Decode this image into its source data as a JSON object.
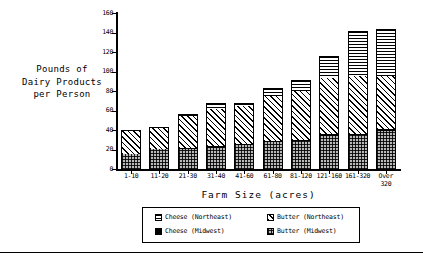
{
  "axis_titles": {
    "y": "Pounds of\nDairy Products\nper Person",
    "x": "Farm Size  (acres)"
  },
  "yticks": [
    "0",
    "20",
    "40",
    "60",
    "80",
    "100",
    "120",
    "140",
    "160"
  ],
  "legend": {
    "items": [
      {
        "label": "Cheese (Northeast)",
        "key": "cheese_ne",
        "pattern": "horizontal-lines"
      },
      {
        "label": "Butter (Northeast)",
        "key": "butter_ne",
        "pattern": "diagonal-hatch"
      },
      {
        "label": "Cheese (Midwest)",
        "key": "cheese_mw",
        "pattern": "solid-black"
      },
      {
        "label": "Butter (Midwest)",
        "key": "butter_mw",
        "pattern": "cross-dots"
      }
    ]
  },
  "chart_data": {
    "type": "bar",
    "title": "",
    "xlabel": "Farm Size  (acres)",
    "ylabel": "Pounds of Dairy Products per Person",
    "ylim": [
      0,
      160
    ],
    "ytick_step": 20,
    "grid": false,
    "stacked": true,
    "legend_position": "bottom",
    "categories": [
      "1-10",
      "11-20",
      "21-30",
      "31-40",
      "41-60",
      "61-80",
      "81-120",
      "121-160",
      "161-320",
      "Over\n320"
    ],
    "category_labels_flat": [
      "1-10",
      "11-20",
      "21-30",
      "31-40",
      "41-60",
      "61-80",
      "81-120",
      "121-160",
      "161-320",
      "Over 320"
    ],
    "series": [
      {
        "name": "Butter (Midwest)",
        "values": [
          15,
          21,
          21,
          22,
          25,
          28,
          29,
          34,
          35,
          39
        ]
      },
      {
        "name": "Cheese (Midwest)",
        "values": [
          0,
          0,
          1,
          2,
          1,
          1,
          1,
          2,
          1,
          2
        ]
      },
      {
        "name": "Butter (Northeast)",
        "values": [
          25,
          22,
          32,
          38,
          39,
          46,
          50,
          57,
          59,
          54
        ]
      },
      {
        "name": "Cheese (Northeast)",
        "values": [
          0,
          0,
          2,
          6,
          3,
          8,
          11,
          23,
          47,
          49
        ]
      }
    ],
    "totals": [
      40,
      43,
      56,
      68,
      68,
      83,
      91,
      116,
      142,
      144
    ]
  }
}
